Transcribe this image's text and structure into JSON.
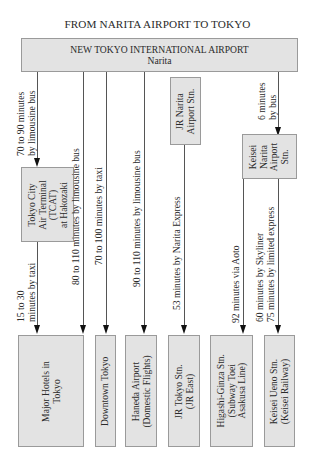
{
  "title": "FROM NARITA AIRPORT TO TOKYO",
  "origin": {
    "line1": "NEW TOKYO INTERNATIONAL AIRPORT",
    "line2": "Narita"
  },
  "intermediate": {
    "tcat": {
      "l1": "Tokyo City",
      "l2": "Air Terminal",
      "l3": "(TCAT)",
      "l4": "at Hakozaki"
    },
    "jr_narita": {
      "l1": "JR Narita",
      "l2": "Airport Stn."
    },
    "keisei_narita": {
      "l1": "Keisei",
      "l2": "Narita",
      "l3": "Airport",
      "l4": "Stn."
    }
  },
  "routes": {
    "to_tcat": {
      "l1": "70 to 90 minutes",
      "l2": "by limousine bus"
    },
    "tcat_to_hotels": {
      "l1": "15 to 30",
      "l2": "minutes by taxi"
    },
    "to_downtown_bus": "80 to 110 minutes by limousine bus",
    "to_downtown_taxi": "70 to 100 minutes by taxi",
    "to_haneda": "90 to 110 minutes by limousine bus",
    "jr_to_tokyo": "53 minutes by Narita Express",
    "to_keisei": {
      "l1": "6 minutes",
      "l2": "by bus"
    },
    "keisei_to_higashi": "92 minutes via Aoto",
    "keisei_to_ueno_1": "60 minutes by Skyliner",
    "keisei_to_ueno_2": "75 minutes by limited express"
  },
  "destinations": {
    "hotels": {
      "l1": "Major Hotels in",
      "l2": "Tokyo"
    },
    "downtown": {
      "l1": "Downtown Tokyo"
    },
    "haneda": {
      "l1": "Haneda Airport",
      "l2": "(Domestic Flights)"
    },
    "jr_tokyo": {
      "l1": "JR Tokyo Stn.",
      "l2": "(JR East)"
    },
    "higashi": {
      "l1": "Higashi-Ginza Stn.",
      "l2": "(Subway Toei",
      "l3": "Asakusa Line)"
    },
    "keisei_ueno": {
      "l1": "Keisei Ueno Stn.",
      "l2": "(Keisei Railway)"
    }
  },
  "colors": {
    "box_fill": "#e3e3e3",
    "box_border": "#9a9a9a",
    "line": "#555555",
    "arrow": "#111111"
  }
}
